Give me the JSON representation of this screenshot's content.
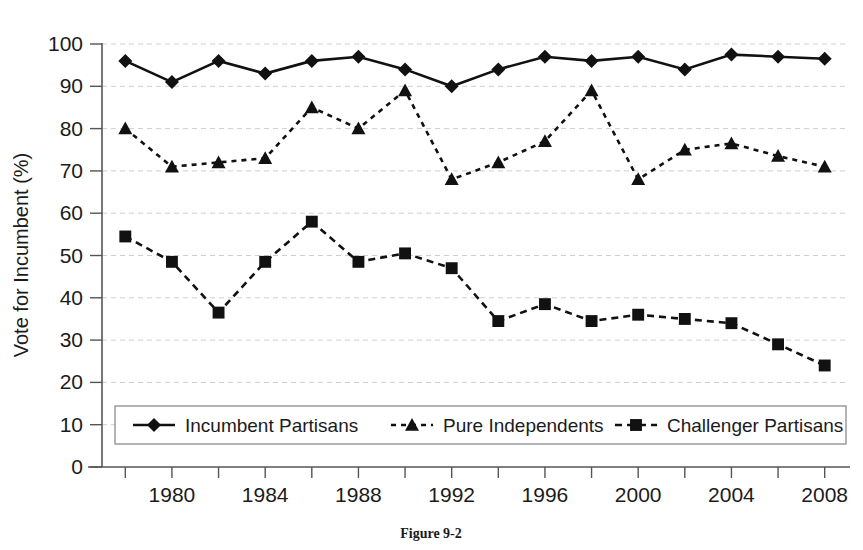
{
  "figure": {
    "caption": "Figure 9-2"
  },
  "chart_data": {
    "type": "line",
    "title": "",
    "xlabel": "",
    "ylabel": "Vote for Incumbent (%)",
    "xlim": [
      1977,
      2009
    ],
    "ylim": [
      0,
      100
    ],
    "grid": true,
    "legend_position": "bottom-inside",
    "x": [
      1978,
      1980,
      1982,
      1984,
      1986,
      1988,
      1990,
      1992,
      1994,
      1996,
      1998,
      2000,
      2002,
      2004,
      2006,
      2008
    ],
    "x_tick_labels": [
      "1980",
      "1984",
      "1988",
      "1992",
      "1996",
      "2000",
      "2004",
      "2008"
    ],
    "x_tick_values": [
      1980,
      1984,
      1988,
      1992,
      1996,
      2000,
      2004,
      2008
    ],
    "x_minor_tick_values": [
      1978,
      1982,
      1986,
      1990,
      1994,
      1998,
      2002,
      2006
    ],
    "y_tick_labels": [
      "0",
      "10",
      "20",
      "30",
      "40",
      "50",
      "60",
      "70",
      "80",
      "90",
      "100"
    ],
    "y_tick_values": [
      0,
      10,
      20,
      30,
      40,
      50,
      60,
      70,
      80,
      90,
      100
    ],
    "series": [
      {
        "name": "Incumbent Partisans",
        "marker": "diamond",
        "line_style": "solid",
        "color": "#111111",
        "values": [
          96,
          91,
          96,
          93,
          96,
          97,
          94,
          90,
          94,
          97,
          96,
          97,
          94,
          97.5,
          97,
          96.5
        ]
      },
      {
        "name": "Pure Independents",
        "marker": "triangle",
        "line_style": "dotted",
        "color": "#111111",
        "values": [
          80,
          71,
          72,
          73,
          85,
          80,
          89,
          68,
          72,
          77,
          89,
          68,
          75,
          76.5,
          73.5,
          71
        ]
      },
      {
        "name": "Challenger Partisans",
        "marker": "square",
        "line_style": "dashed",
        "color": "#111111",
        "values": [
          54.5,
          48.5,
          36.5,
          48.5,
          58,
          48.5,
          50.5,
          47,
          34.5,
          38.5,
          34.5,
          36,
          35,
          34,
          29,
          24
        ]
      }
    ]
  },
  "legend": {
    "items": [
      {
        "label": "Incumbent Partisans",
        "marker": "diamond",
        "line_style": "solid"
      },
      {
        "label": "Pure Independents",
        "marker": "triangle",
        "line_style": "dotted"
      },
      {
        "label": "Challenger Partisans",
        "marker": "square",
        "line_style": "dashed"
      }
    ]
  }
}
